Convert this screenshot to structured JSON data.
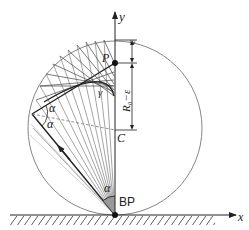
{
  "diagram": {
    "type": "geometric-optics",
    "axes": {
      "x_label": "x",
      "y_label": "y"
    },
    "points": {
      "P": "P",
      "C": "C",
      "BP": "BP"
    },
    "curves": {
      "caustic": "γ"
    },
    "angles": {
      "alpha_top": "α",
      "alpha_mid": "α",
      "alpha_bottom": "α"
    },
    "dimensions": {
      "epsilon": "ε",
      "r0_minus_epsilon": "R₀−ε"
    },
    "colors": {
      "stroke": "#222222",
      "thin_ray": "#555555",
      "light_ray": "#aaaaaa",
      "circle": "#777777",
      "shade": "#999999"
    }
  }
}
